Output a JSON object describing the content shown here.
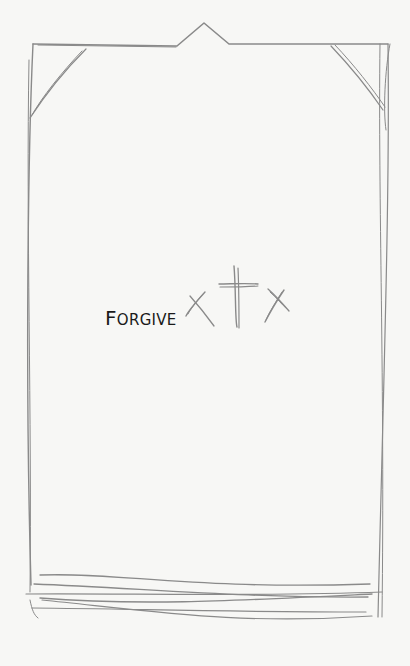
{
  "card": {
    "title": "Forgive",
    "title_first": "F",
    "title_rest": "ORGIVE",
    "icon": "three-crosses-icon"
  },
  "colors": {
    "background": "#f7f7f5",
    "sketch_stroke": "#8a8a8a",
    "text": "#1a1a1a"
  }
}
